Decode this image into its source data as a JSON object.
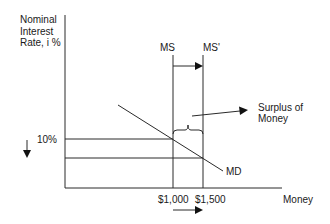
{
  "diagram": {
    "type": "money-market",
    "y_axis": {
      "label": "Nominal\nInterest\nRate, i %"
    },
    "x_axis": {
      "label": "Money"
    },
    "curves": {
      "ms": "MS",
      "ms_prime": "MS'",
      "md": "MD"
    },
    "annotations": {
      "surplus": "Surplus of\nMoney",
      "rate_10": "10%",
      "q1": "$1,000",
      "q2": "$1,500"
    },
    "colors": {
      "line": "#2a2a2a",
      "text": "#1a1a1a",
      "background": "#ffffff"
    }
  }
}
